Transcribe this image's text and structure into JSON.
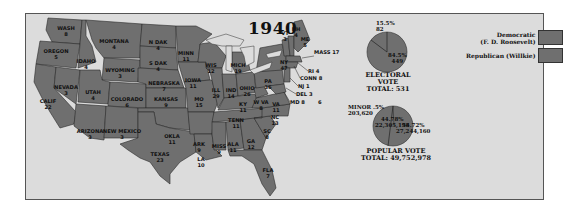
{
  "title": "1940",
  "legend": [
    {
      "label_line1": "Democratic",
      "label_line2": "(F. D. Roosevelt)",
      "color": "#6f6f6f"
    },
    {
      "label_line1": "Republican (Willkie)",
      "label_line2": "",
      "color": "#6f6f6f"
    }
  ],
  "states": [
    {
      "abbr": "WASH",
      "ev": "8"
    },
    {
      "abbr": "OREGON",
      "ev": "5"
    },
    {
      "abbr": "CALIF",
      "ev": "22"
    },
    {
      "abbr": "NEVADA",
      "ev": "3"
    },
    {
      "abbr": "IDAHO",
      "ev": "4"
    },
    {
      "abbr": "MONTANA",
      "ev": "4"
    },
    {
      "abbr": "WYOMING",
      "ev": "3"
    },
    {
      "abbr": "UTAH",
      "ev": "4"
    },
    {
      "abbr": "ARIZONA",
      "ev": "3"
    },
    {
      "abbr": "COLORADO",
      "ev": "6"
    },
    {
      "abbr": "NEW MEXICO",
      "ev": "3"
    },
    {
      "abbr": "N DAK",
      "ev": "4"
    },
    {
      "abbr": "S DAK",
      "ev": "4"
    },
    {
      "abbr": "NEBRASKA",
      "ev": "7"
    },
    {
      "abbr": "KANSAS",
      "ev": "9"
    },
    {
      "abbr": "OKLA",
      "ev": "11"
    },
    {
      "abbr": "TEXAS",
      "ev": "23"
    },
    {
      "abbr": "MINN",
      "ev": "11"
    },
    {
      "abbr": "IOWA",
      "ev": "11"
    },
    {
      "abbr": "MO",
      "ev": "15"
    },
    {
      "abbr": "ARK",
      "ev": "9"
    },
    {
      "abbr": "LA",
      "ev": "10"
    },
    {
      "abbr": "WIS",
      "ev": "12"
    },
    {
      "abbr": "ILL",
      "ev": "29"
    },
    {
      "abbr": "MICH",
      "ev": "19"
    },
    {
      "abbr": "IND",
      "ev": "14"
    },
    {
      "abbr": "OHIO",
      "ev": "26"
    },
    {
      "abbr": "KY",
      "ev": "11"
    },
    {
      "abbr": "TENN",
      "ev": "11"
    },
    {
      "abbr": "MISS",
      "ev": "9"
    },
    {
      "abbr": "ALA",
      "ev": "11"
    },
    {
      "abbr": "GA",
      "ev": "12"
    },
    {
      "abbr": "FLA",
      "ev": "7"
    },
    {
      "abbr": "SC",
      "ev": "8"
    },
    {
      "abbr": "NC",
      "ev": "13"
    },
    {
      "abbr": "VA",
      "ev": "11"
    },
    {
      "abbr": "W VA",
      "ev": "8"
    },
    {
      "abbr": "PA",
      "ev": "36"
    },
    {
      "abbr": "NY",
      "ev": "47"
    },
    {
      "abbr": "VT",
      "ev": "3"
    },
    {
      "abbr": "NH",
      "ev": "4"
    },
    {
      "abbr": "ME",
      "ev": "5"
    },
    {
      "abbr": "MASS",
      "ev": "17"
    },
    {
      "abbr": "RI",
      "ev": "4"
    },
    {
      "abbr": "CONN",
      "ev": "8"
    },
    {
      "abbr": "NJ",
      "ev": "16"
    },
    {
      "abbr": "DEL",
      "ev": "3"
    },
    {
      "abbr": "MD",
      "ev": "8"
    }
  ],
  "east_labels": {
    "mass": "MASS 17",
    "ri": "RI 4",
    "conn": "CONN 8",
    "nj": "NJ 1",
    "del": "DEL 3",
    "md": "MD 8",
    "extra": "6"
  },
  "electoral_vote": {
    "caption_line1": "ELECTORAL VOTE",
    "caption_line2": "TOTAL: 531",
    "rep_pct": "15.5%",
    "rep_votes": "82",
    "dem_pct": "84.5%",
    "dem_votes": "449"
  },
  "popular_vote": {
    "caption_line1": "POPULAR VOTE",
    "caption_line2": "TOTAL: 49,752,978",
    "minor_pct": "MINOR .5%",
    "minor_votes": "203,620",
    "rep_pct": "44.78%",
    "rep_votes": "22,305,198",
    "dem_pct": "54.72%",
    "dem_votes": "27,244,160"
  }
}
